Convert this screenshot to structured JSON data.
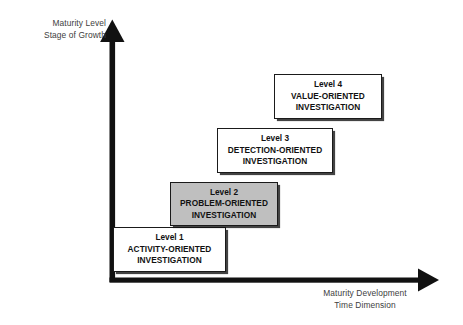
{
  "diagram": {
    "axes": {
      "y_label_line1": "Maturity Level",
      "y_label_line2": "Stage of Growth",
      "x_label_line1": "Maturity Development",
      "x_label_line2": "Time Dimension",
      "axis_color": "#111111",
      "label_color": "#404040"
    },
    "levels": [
      {
        "title": "Level 1",
        "desc_line1": "ACTIVITY-ORIENTED",
        "desc_line2": "INVESTIGATION",
        "fill": "#ffffff",
        "shaded": false
      },
      {
        "title": "Level 2",
        "desc_line1": "PROBLEM-ORIENTED",
        "desc_line2": "INVESTIGATION",
        "fill": "#bfbfbf",
        "shaded": true
      },
      {
        "title": "Level 3",
        "desc_line1": "DETECTION-ORIENTED",
        "desc_line2": "INVESTIGATION",
        "fill": "#ffffff",
        "shaded": false
      },
      {
        "title": "Level 4",
        "desc_line1": "VALUE-ORIENTED",
        "desc_line2": "INVESTIGATION",
        "fill": "#ffffff",
        "shaded": false
      }
    ]
  }
}
